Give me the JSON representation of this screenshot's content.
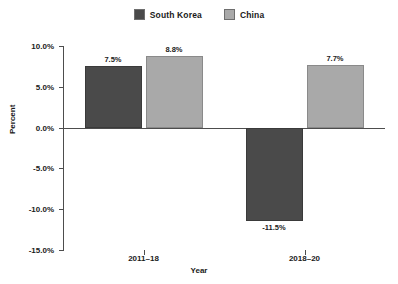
{
  "chart_data": {
    "type": "bar",
    "title": "",
    "xlabel": "Year",
    "ylabel": "Percent",
    "categories": [
      "2011–18",
      "2018–20"
    ],
    "series": [
      {
        "name": "South Korea",
        "color": "#4a4a4a",
        "values": [
          7.5,
          -11.5
        ],
        "labels": [
          "7.5%",
          "-11.5%"
        ]
      },
      {
        "name": "China",
        "color": "#a9a9a9",
        "values": [
          8.8,
          7.7
        ],
        "labels": [
          "8.8%",
          "7.7%"
        ]
      }
    ],
    "ylim": [
      -15.0,
      10.0
    ],
    "ytick_values": [
      10.0,
      5.0,
      0.0,
      -5.0,
      -10.0,
      -15.0
    ],
    "ytick_labels": [
      "10.0%",
      "5.0%",
      "0.0%",
      "-5.0%",
      "-10.0%",
      "-15.0%"
    ],
    "grid": false,
    "legend_position": "top-center",
    "value_labels_shown": true,
    "units": "percent"
  },
  "legend": {
    "entries": [
      {
        "label": "South Korea",
        "color": "#4a4a4a"
      },
      {
        "label": "China",
        "color": "#a9a9a9"
      }
    ]
  },
  "axes": {
    "y_title": "Percent",
    "x_title": "Year"
  }
}
